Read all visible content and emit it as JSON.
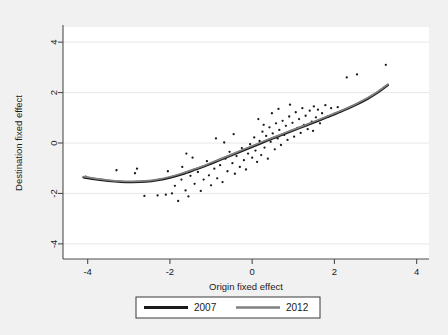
{
  "chart_data": {
    "type": "scatter",
    "title": "",
    "xlabel": "Origin fixed effect",
    "ylabel": "Destination fixed effect",
    "xlim": [
      -4.6,
      4.3
    ],
    "ylim": [
      -4.6,
      4.6
    ],
    "xticks": [
      -4,
      -2,
      0,
      2,
      4
    ],
    "yticks": [
      -4,
      -2,
      0,
      2,
      4
    ],
    "xtick_labels": [
      "-4",
      "-2",
      "0",
      "2",
      "4"
    ],
    "ytick_labels": [
      "-4",
      "-2",
      "0",
      "2",
      "4"
    ],
    "grid": "horizontal-faint",
    "legend_position": "below-plot",
    "colors": {
      "series_2007": "#1a1a1a",
      "series_2012": "#808080",
      "points": "#1a1a1a",
      "plot_background": "#ffffff",
      "figure_background": "#f1f1f1",
      "gridline": "#e8e8e8",
      "axis": "#4d4d4d"
    },
    "series": [
      {
        "name": "2007",
        "type": "line",
        "color": "#1a1a1a",
        "points": [
          [
            -4.1,
            -1.36
          ],
          [
            -3.8,
            -1.44
          ],
          [
            -3.5,
            -1.5
          ],
          [
            -3.2,
            -1.54
          ],
          [
            -2.9,
            -1.55
          ],
          [
            -2.6,
            -1.53
          ],
          [
            -2.3,
            -1.47
          ],
          [
            -2.0,
            -1.37
          ],
          [
            -1.7,
            -1.23
          ],
          [
            -1.4,
            -1.06
          ],
          [
            -1.1,
            -0.88
          ],
          [
            -0.8,
            -0.68
          ],
          [
            -0.5,
            -0.48
          ],
          [
            -0.2,
            -0.28
          ],
          [
            0.1,
            -0.08
          ],
          [
            0.4,
            0.12
          ],
          [
            0.7,
            0.31
          ],
          [
            1.0,
            0.5
          ],
          [
            1.3,
            0.69
          ],
          [
            1.6,
            0.88
          ],
          [
            1.9,
            1.08
          ],
          [
            2.2,
            1.28
          ],
          [
            2.5,
            1.5
          ],
          [
            2.8,
            1.75
          ],
          [
            3.05,
            2.0
          ],
          [
            3.2,
            2.18
          ],
          [
            3.3,
            2.3
          ]
        ]
      },
      {
        "name": "2012",
        "type": "line",
        "color": "#808080",
        "points": [
          [
            -4.1,
            -1.33
          ],
          [
            -3.8,
            -1.41
          ],
          [
            -3.5,
            -1.47
          ],
          [
            -3.2,
            -1.51
          ],
          [
            -2.9,
            -1.52
          ],
          [
            -2.6,
            -1.5
          ],
          [
            -2.3,
            -1.44
          ],
          [
            -2.0,
            -1.34
          ],
          [
            -1.7,
            -1.2
          ],
          [
            -1.4,
            -1.03
          ],
          [
            -1.1,
            -0.85
          ],
          [
            -0.8,
            -0.65
          ],
          [
            -0.5,
            -0.45
          ],
          [
            -0.2,
            -0.25
          ],
          [
            0.1,
            -0.05
          ],
          [
            0.4,
            0.15
          ],
          [
            0.7,
            0.34
          ],
          [
            1.0,
            0.53
          ],
          [
            1.3,
            0.72
          ],
          [
            1.6,
            0.91
          ],
          [
            1.9,
            1.11
          ],
          [
            2.2,
            1.31
          ],
          [
            2.5,
            1.53
          ],
          [
            2.8,
            1.78
          ],
          [
            3.05,
            2.03
          ],
          [
            3.2,
            2.21
          ],
          [
            3.3,
            2.33
          ]
        ]
      },
      {
        "name": "observations",
        "type": "scatter",
        "color": "#1a1a1a",
        "points": [
          [
            -4.05,
            -1.33
          ],
          [
            -3.3,
            -1.08
          ],
          [
            -2.85,
            -1.2
          ],
          [
            -2.8,
            -1.02
          ],
          [
            -2.62,
            -2.1
          ],
          [
            -2.3,
            -2.08
          ],
          [
            -2.1,
            -2.05
          ],
          [
            -1.95,
            -2.0
          ],
          [
            -1.88,
            -1.7
          ],
          [
            -1.8,
            -2.3
          ],
          [
            -1.72,
            -1.45
          ],
          [
            -1.7,
            -0.95
          ],
          [
            -1.62,
            -1.88
          ],
          [
            -1.55,
            -2.12
          ],
          [
            -1.5,
            -1.3
          ],
          [
            -1.45,
            -0.58
          ],
          [
            -1.4,
            -1.62
          ],
          [
            -1.32,
            -1.15
          ],
          [
            -1.25,
            -1.9
          ],
          [
            -1.18,
            -1.45
          ],
          [
            -1.1,
            -0.72
          ],
          [
            -1.05,
            -1.28
          ],
          [
            -1.0,
            -1.68
          ],
          [
            -0.92,
            -1.02
          ],
          [
            -0.85,
            -1.4
          ],
          [
            -0.78,
            -0.88
          ],
          [
            -0.72,
            -1.55
          ],
          [
            -0.65,
            -0.62
          ],
          [
            -0.6,
            -1.12
          ],
          [
            -0.55,
            -0.35
          ],
          [
            -0.48,
            -0.8
          ],
          [
            -0.42,
            -1.22
          ],
          [
            -0.38,
            -0.52
          ],
          [
            -0.3,
            -0.95
          ],
          [
            -0.25,
            -0.2
          ],
          [
            -0.2,
            -0.68
          ],
          [
            -0.15,
            -1.05
          ],
          [
            -0.1,
            -0.42
          ],
          [
            -0.05,
            -0.05
          ],
          [
            0.0,
            -0.58
          ],
          [
            0.05,
            0.22
          ],
          [
            0.08,
            -0.3
          ],
          [
            0.12,
            -0.75
          ],
          [
            0.18,
            0.08
          ],
          [
            0.22,
            -0.48
          ],
          [
            0.25,
            0.45
          ],
          [
            0.3,
            -0.18
          ],
          [
            0.34,
            0.28
          ],
          [
            0.38,
            -0.62
          ],
          [
            0.42,
            0.62
          ],
          [
            0.45,
            0.05
          ],
          [
            0.5,
            0.38
          ],
          [
            0.55,
            -0.25
          ],
          [
            0.58,
            0.78
          ],
          [
            0.62,
            0.18
          ],
          [
            0.66,
            0.52
          ],
          [
            0.7,
            -0.08
          ],
          [
            0.74,
            0.88
          ],
          [
            0.78,
            0.32
          ],
          [
            0.82,
            0.68
          ],
          [
            0.86,
            0.12
          ],
          [
            0.9,
            1.05
          ],
          [
            0.94,
            0.48
          ],
          [
            0.98,
            0.8
          ],
          [
            1.02,
            0.25
          ],
          [
            1.06,
            1.22
          ],
          [
            1.1,
            0.6
          ],
          [
            1.14,
            0.95
          ],
          [
            1.18,
            0.4
          ],
          [
            1.22,
            1.38
          ],
          [
            1.26,
            0.72
          ],
          [
            1.3,
            1.08
          ],
          [
            1.35,
            0.55
          ],
          [
            1.4,
            1.28
          ],
          [
            1.45,
            0.85
          ],
          [
            1.5,
            1.45
          ],
          [
            1.55,
            1.02
          ],
          [
            1.6,
            1.32
          ],
          [
            1.65,
            0.78
          ],
          [
            1.7,
            1.18
          ],
          [
            1.78,
            1.5
          ],
          [
            1.85,
            1.05
          ],
          [
            1.92,
            1.38
          ],
          [
            2.0,
            1.15
          ],
          [
            2.08,
            1.42
          ],
          [
            2.15,
            1.25
          ],
          [
            2.3,
            2.6
          ],
          [
            2.55,
            2.72
          ],
          [
            3.25,
            3.1
          ],
          [
            -0.88,
            0.18
          ],
          [
            -0.45,
            0.35
          ],
          [
            0.15,
            0.95
          ],
          [
            0.48,
            1.18
          ],
          [
            0.92,
            1.52
          ],
          [
            -1.6,
            -0.42
          ],
          [
            -2.05,
            -1.12
          ],
          [
            0.64,
            1.35
          ],
          [
            1.48,
            0.48
          ],
          [
            -0.68,
            0.02
          ],
          [
            0.28,
            0.72
          ]
        ]
      }
    ]
  },
  "legend": {
    "items": [
      {
        "label": "2007",
        "color": "#1a1a1a"
      },
      {
        "label": "2012",
        "color": "#808080"
      }
    ]
  }
}
